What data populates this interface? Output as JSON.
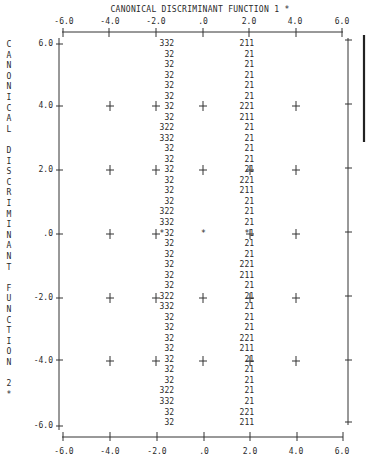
{
  "chart_data": {
    "type": "territorial_map",
    "title": "CANONICAL DISCRIMINANT FUNCTION 1 *",
    "xlabel": "CANONICAL DISCRIMINANT FUNCTION 1",
    "ylabel": "CANONICAL DISCRIMINANT FUNCTION 2",
    "xlim": [
      -6.0,
      6.0
    ],
    "ylim": [
      -6.0,
      6.0
    ],
    "x_ticks": [
      "-6.0",
      "-4.0",
      "-2.0",
      ".0",
      "2.0",
      "4.0",
      "6.0"
    ],
    "y_ticks": [
      "6.0",
      "4.0",
      "2.0",
      ".0",
      "-2.0",
      "-4.0",
      "-6.0"
    ],
    "grid": "plus markers at tick intersections",
    "group_symbols": [
      "1",
      "2",
      "3"
    ],
    "centroid_marker": "*",
    "centroids_row": ".0",
    "boundary_rows": [
      {
        "y": "6.0",
        "left": "332",
        "right": "211"
      },
      {
        "y": "",
        "left": "32",
        "right": "21"
      },
      {
        "y": "",
        "left": "32",
        "right": "21"
      },
      {
        "y": "",
        "left": "32",
        "right": "21"
      },
      {
        "y": "",
        "left": "32",
        "right": "21"
      },
      {
        "y": "",
        "left": "32",
        "right": "21"
      },
      {
        "y": "4.0",
        "left": "32",
        "right": "221"
      },
      {
        "y": "",
        "left": "32",
        "right": "211"
      },
      {
        "y": "",
        "left": "322",
        "right": "21"
      },
      {
        "y": "",
        "left": "332",
        "right": "21"
      },
      {
        "y": "",
        "left": "32",
        "right": "21"
      },
      {
        "y": "",
        "left": "32",
        "right": "21"
      },
      {
        "y": "2.0",
        "left": "32",
        "right": "21"
      },
      {
        "y": "",
        "left": "32",
        "right": "221"
      },
      {
        "y": "",
        "left": "32",
        "right": "211"
      },
      {
        "y": "",
        "left": "32",
        "right": "21"
      },
      {
        "y": "",
        "left": "322",
        "right": "21"
      },
      {
        "y": "",
        "left": "332",
        "right": "21"
      },
      {
        "y": ".0",
        "left": "*32",
        "right": "*1"
      },
      {
        "y": "",
        "left": "32",
        "right": "21"
      },
      {
        "y": "",
        "left": "32",
        "right": "21"
      },
      {
        "y": "",
        "left": "32",
        "right": "221"
      },
      {
        "y": "",
        "left": "32",
        "right": "211"
      },
      {
        "y": "",
        "left": "32",
        "right": "21"
      },
      {
        "y": "-2.0",
        "left": "322",
        "right": "21"
      },
      {
        "y": "",
        "left": "332",
        "right": "21"
      },
      {
        "y": "",
        "left": "32",
        "right": "21"
      },
      {
        "y": "",
        "left": "32",
        "right": "21"
      },
      {
        "y": "",
        "left": "32",
        "right": "221"
      },
      {
        "y": "",
        "left": "32",
        "right": "211"
      },
      {
        "y": "-4.0",
        "left": "32",
        "right": "21"
      },
      {
        "y": "",
        "left": "32",
        "right": "21"
      },
      {
        "y": "",
        "left": "32",
        "right": "21"
      },
      {
        "y": "",
        "left": "322",
        "right": "21"
      },
      {
        "y": "",
        "left": "332",
        "right": "21"
      },
      {
        "y": "",
        "left": "32",
        "right": "221"
      },
      {
        "y": "-6.0",
        "left": "32",
        "right": "211"
      }
    ]
  },
  "title": "CANONICAL DISCRIMINANT FUNCTION 1 *",
  "x_axis": {
    "top_labels": [
      "-6.0",
      "-4.0",
      "-2.0",
      ".0",
      "2.0",
      "4.0",
      "6.0"
    ],
    "bottom_labels": [
      "-6.0",
      "-4.0",
      "-2.0",
      ".0",
      "2.0",
      "4.0",
      "6.0"
    ]
  },
  "y_axis": {
    "labels": [
      "6.0",
      "4.0",
      "2.0",
      ".0",
      "-2.0",
      "-4.0",
      "-6.0"
    ],
    "vertical_title_letters": [
      "C",
      "A",
      "N",
      "O",
      "N",
      "I",
      "C",
      "A",
      "L",
      "",
      "D",
      "I",
      "S",
      "C",
      "R",
      "I",
      "M",
      "I",
      "N",
      "A",
      "N",
      "T",
      "",
      "F",
      "U",
      "N",
      "C",
      "T",
      "I",
      "O",
      "N",
      "",
      "2",
      "*"
    ]
  },
  "map_rows": {
    "left": [
      "332",
      "32",
      "32",
      "32",
      "32",
      "32",
      "32",
      "32",
      "322",
      "332",
      "32",
      "32",
      "32",
      "32",
      "32",
      "32",
      "322",
      "332",
      "*32",
      "32",
      "32",
      "32",
      "32",
      "32",
      "322",
      "332",
      "32",
      "32",
      "32",
      "32",
      "32",
      "32",
      "32",
      "322",
      "332",
      "32",
      "32"
    ],
    "right": [
      "211",
      "21",
      "21",
      "21",
      "21",
      "21",
      "221",
      "211",
      "21",
      "21",
      "21",
      "21",
      "21",
      "221",
      "211",
      "21",
      "21",
      "21",
      "*1",
      "21",
      "21",
      "221",
      "211",
      "21",
      "21",
      "21",
      "21",
      "21",
      "221",
      "211",
      "21",
      "21",
      "21",
      "21",
      "21",
      "221",
      "211"
    ]
  },
  "centroid_symbol": "*"
}
